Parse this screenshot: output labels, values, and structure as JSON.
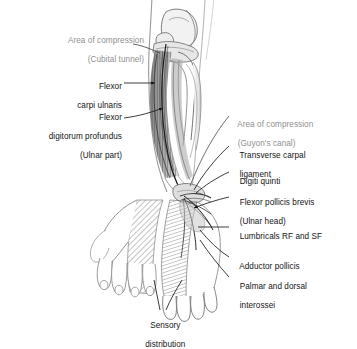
{
  "figure": {
    "background_color": "#ffffff",
    "label_color": "#141414",
    "compression_label_color": "#8f8f8f",
    "ink_color": "#2b2b2b"
  },
  "labels": {
    "cubital_tunnel": {
      "line1": "Area of compression",
      "line2": "(Cubital tunnel)",
      "kind": "compression"
    },
    "flexor_carpi_ulnaris": {
      "line1": "Flexor",
      "line2": "carpi ulnaris",
      "kind": "anatomy"
    },
    "flexor_digitorum_profundus": {
      "line1": "Flexor",
      "line2": "digitorum profundus",
      "line3": "(Ulnar part)",
      "kind": "anatomy"
    },
    "guyons_canal": {
      "line1": "Area of compression",
      "line2": "(Guyon's canal)",
      "kind": "compression"
    },
    "transverse_carpal_ligament": {
      "line1": "Transverse carpal",
      "line2": "ligament",
      "kind": "anatomy"
    },
    "digiti_quinti": {
      "line1": "Digiti quinti",
      "kind": "anatomy"
    },
    "flexor_pollicis_brevis": {
      "line1": "Flexor pollicis brevis",
      "line2": "(Ulnar head)",
      "kind": "anatomy"
    },
    "lumbricals": {
      "line1": "Lumbricals RF and SF",
      "kind": "anatomy"
    },
    "adductor_pollicis": {
      "line1": "Adductor pollicis",
      "kind": "anatomy"
    },
    "interossei": {
      "line1": "Palmar and dorsal",
      "line2": "interossei",
      "kind": "anatomy"
    },
    "sensory_distribution": {
      "line1": "Sensory",
      "line2": "distribution",
      "kind": "anatomy"
    }
  }
}
